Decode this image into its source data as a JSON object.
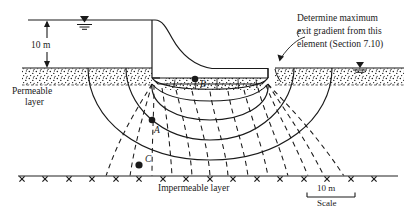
{
  "figure": {
    "ink_color": "#1a1a1a",
    "background_color": "#ffffff"
  },
  "dimensions": {
    "head_label": "10 m"
  },
  "labels": {
    "permeable_line1": "Permeable",
    "permeable_line2": "layer",
    "impermeable": "Impermeable layer"
  },
  "annotation": {
    "line1": "Determine maximum",
    "line2": "exit gradient from this",
    "line3": "element (Section 7.10)"
  },
  "points": [
    {
      "id": "B",
      "label": "B"
    },
    {
      "id": "A",
      "label": "A"
    },
    {
      "id": "C",
      "label": "C"
    }
  ],
  "scale": {
    "value": "10 m",
    "caption": "Scale"
  },
  "icons": {
    "upstream_water_table": "water-table-icon",
    "downstream_water_table": "water-table-icon",
    "dimension_arrow": "dimension-arrow-icon",
    "leader_arrow": "leader-arrow-icon"
  },
  "flownet": {
    "flow_lines": 4,
    "equipotential_lines": 12,
    "description": "solid flow lines and dashed equipotential lines"
  }
}
